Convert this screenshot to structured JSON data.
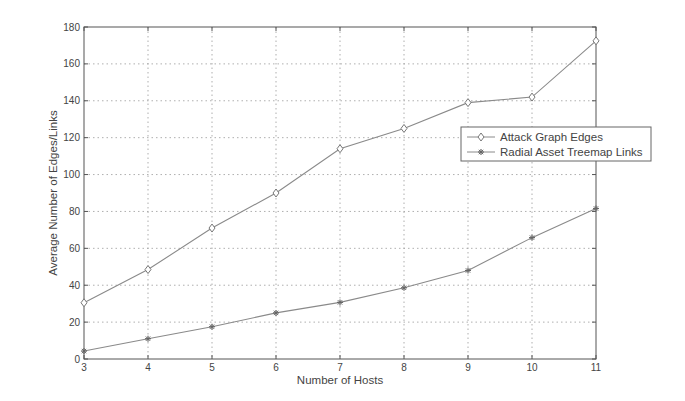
{
  "chart_data": {
    "type": "line",
    "title": "",
    "xlabel": "Number of Hosts",
    "ylabel": "Average Number of Edges/Links",
    "x": [
      3,
      4,
      5,
      6,
      7,
      8,
      9,
      10,
      11
    ],
    "xlim": [
      3,
      11
    ],
    "ylim": [
      0,
      180
    ],
    "xticks": [
      3,
      4,
      5,
      6,
      7,
      8,
      9,
      10,
      11
    ],
    "yticks": [
      0,
      20,
      40,
      60,
      80,
      100,
      120,
      140,
      160,
      180
    ],
    "grid": true,
    "legend_position": "right-center (overlapping right edge)",
    "series": [
      {
        "name": "Attack Graph Edges",
        "marker": "diamond-open",
        "values": [
          30.5,
          48.5,
          71,
          90,
          114,
          125,
          139,
          142,
          172.5
        ]
      },
      {
        "name": "Radial Asset Treemap Links",
        "marker": "asterisk",
        "values": [
          4.3,
          11,
          17.5,
          25,
          30.7,
          38.6,
          48,
          65.8,
          81.6
        ]
      }
    ]
  },
  "colors": {
    "line": "#8a8a8a",
    "axis": "#555555",
    "grid": "#9a9a9a",
    "text": "#444444"
  }
}
